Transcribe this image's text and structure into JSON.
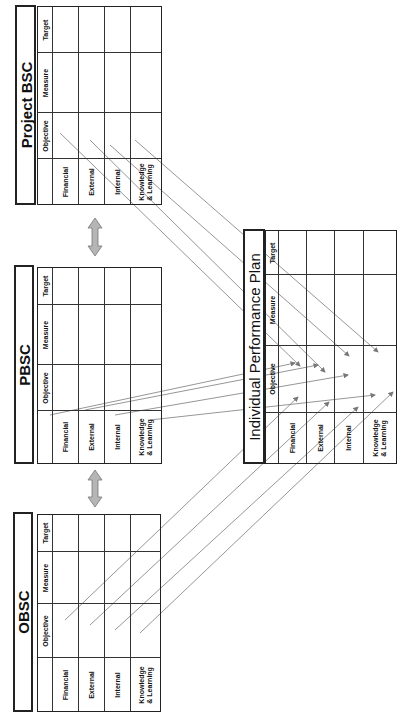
{
  "columns": [
    "Objective",
    "Measure",
    "Target"
  ],
  "rows": [
    "Financial",
    "External",
    "Internal",
    "Knowledge\n& Learning"
  ],
  "tables": {
    "project_bsc": {
      "title": "Project BSC"
    },
    "pbsc": {
      "title": "PBSC"
    },
    "obsc": {
      "title": "OBSC"
    },
    "ipp": {
      "title": "Individual Performance Plan"
    }
  },
  "connectors": {
    "double_arrows": [
      "Project BSC <-> PBSC",
      "PBSC <-> OBSC"
    ],
    "links": [
      "Project BSC Objective -> IPP Objective",
      "PBSC Objective -> IPP Objective",
      "OBSC Objective -> IPP Objective"
    ],
    "line_color": "#888888",
    "arrow_fill": "#b0b0b0"
  }
}
